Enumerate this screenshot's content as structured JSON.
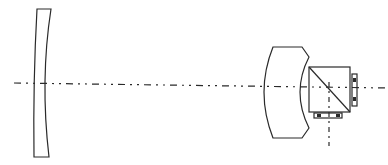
{
  "diagram": {
    "type": "optical-system-schematic",
    "background": "#ffffff",
    "stroke_color": "#2a2a2a",
    "components": [
      {
        "name": "negative-meniscus-lens",
        "role": "front concave lens element"
      },
      {
        "name": "large-lens-element",
        "role": "thick convex lens"
      },
      {
        "name": "beam-splitter-prism",
        "role": "cube prism with diagonal"
      },
      {
        "name": "side-sensor-right",
        "role": "detector plate on right face"
      },
      {
        "name": "bottom-sensor",
        "role": "detector plate on bottom face"
      }
    ],
    "axes": [
      {
        "name": "main-optical-axis",
        "style": "dash-dot",
        "orientation": "horizontal"
      },
      {
        "name": "reflected-optical-axis",
        "style": "dash-dot",
        "orientation": "vertical"
      }
    ]
  }
}
